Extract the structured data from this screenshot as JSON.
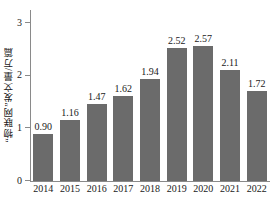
{
  "chart_data": {
    "type": "bar",
    "title": "",
    "subtitle": "",
    "xlabel": "",
    "ylabel": "“物联网”发文量/万篇",
    "categories": [
      "2014",
      "2015",
      "2016",
      "2017",
      "2018",
      "2019",
      "2020",
      "2021",
      "2022"
    ],
    "values": [
      0.9,
      1.16,
      1.47,
      1.62,
      1.94,
      2.52,
      2.57,
      2.11,
      1.72
    ],
    "value_labels": [
      "0.90",
      "1.16",
      "1.47",
      "1.62",
      "1.94",
      "2.52",
      "2.57",
      "2.11",
      "1.72"
    ],
    "ylim": [
      0,
      3.25
    ],
    "yticks": [
      0,
      1,
      2,
      3
    ],
    "ytick_labels": [
      "0",
      "1",
      "2",
      "3"
    ],
    "grid": false,
    "legend": null,
    "legend_position": "none",
    "series": [
      {
        "name": "“物联网”发文量/万篇",
        "values": [
          0.9,
          1.16,
          1.47,
          1.62,
          1.94,
          2.52,
          2.57,
          2.11,
          1.72
        ]
      }
    ],
    "colors": {
      "bar": "#6b6b6b",
      "axis": "#8a8a8a",
      "text": "#1a1a1a",
      "background": "#ffffff"
    }
  }
}
